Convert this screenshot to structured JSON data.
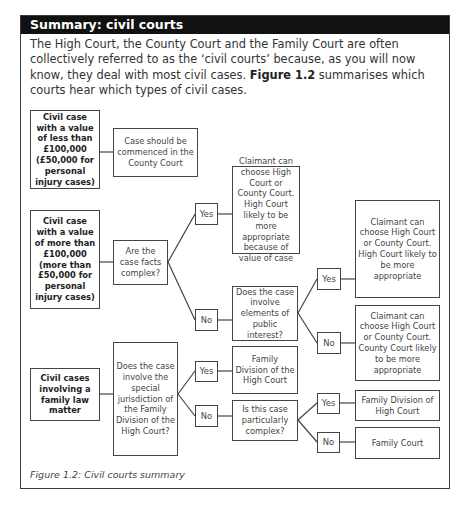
{
  "panel": {
    "title": "Summary: civil courts",
    "intro": {
      "text_before": "The High Court, the County Court and the Family Court are often collectively referred to as the ‘civil courts’ because, as you will now know, they deal with most civil cases. ",
      "figure_ref": "Figure 1.2",
      "text_after": " summarises which courts hear which types of civil cases."
    },
    "caption": "Figure 1.2: Civil courts summary"
  },
  "flowchart": {
    "start_low_value": "Civil case with a value of less than £100,000 (£50,000 for personal injury cases)",
    "outcome_county": "Case should be commenced in the County Court",
    "start_high_value": "Civil case with a value of more than £100,000 (more than £50,000 for personal injury cases)",
    "q_complex": "Are the case facts complex?",
    "yes_1": "Yes",
    "no_1": "No",
    "outcome_high_value": "Claimant can choose High Court or County Court. High Court likely to be more appropriate because of value of case",
    "q_public_interest": "Does the case involve elements of public interest?",
    "yes_2": "Yes",
    "no_2": "No",
    "outcome_high_appropriate": "Claimant can choose High Court or County Court. High Court likely to be more appropriate",
    "outcome_county_appropriate": "Claimant can choose High Court or County Court. County Court likely to be more appropriate",
    "start_family": "Civil cases involving a family law matter",
    "q_special_jurisdiction": "Does the case involve the special jurisdiction of the Family Division of the High Court?",
    "yes_3": "Yes",
    "no_3": "No",
    "outcome_family_division": "Family Division of the High Court",
    "q_particularly_complex": "Is this case particularly complex?",
    "yes_4": "Yes",
    "no_4": "No",
    "outcome_family_division_2": "Family Division of High Court",
    "outcome_family_court": "Family Court"
  }
}
